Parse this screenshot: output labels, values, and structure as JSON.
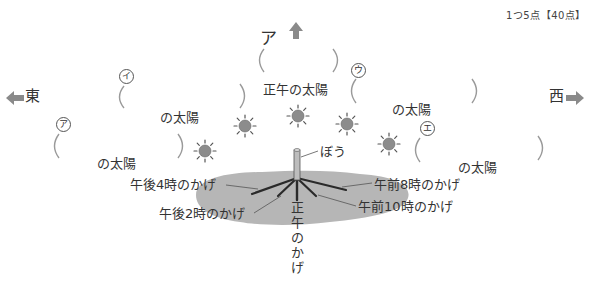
{
  "score_note": "1つ5点【40点】",
  "directions": {
    "north_label": "ア",
    "east": "東",
    "west": "西"
  },
  "answer_blanks": [
    {
      "id": "ア",
      "suffix": "の太陽",
      "position": "east-low"
    },
    {
      "id": "イ",
      "suffix": "の太陽",
      "position": "east-mid"
    },
    {
      "id": "ウ",
      "suffix": "の太陽",
      "position": "west-mid"
    },
    {
      "id": "エ",
      "suffix": "の太陽",
      "position": "west-low"
    }
  ],
  "noon_sun_label": "正午の太陽",
  "top_blank_label": "ア",
  "stick_label": "ぼう",
  "shadow_labels": {
    "pm4": "午後4時のかげ",
    "pm2": "午後2時のかげ",
    "am8": "午前8時のかげ",
    "am10": "午前10時のかげ",
    "noon": [
      "正",
      "午",
      "の",
      "か",
      "げ"
    ]
  },
  "labels": {
    "a_circled": "ア",
    "i_circled": "イ",
    "u_circled": "ウ",
    "e_circled": "エ",
    "sun_suffix_a": "の太陽",
    "sun_suffix_i": "の太陽",
    "sun_suffix_u": "の太陽",
    "sun_suffix_e": "の太陽"
  },
  "colors": {
    "shadow_fill": "#b4b4b4",
    "sun_fill": "#8c8c8c",
    "arrow_fill": "#8a8a8a",
    "paren_stroke": "#9a9a9a",
    "line": "#333333"
  }
}
